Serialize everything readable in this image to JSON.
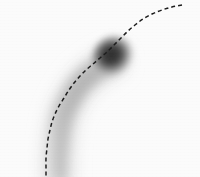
{
  "figure": {
    "title": "Curved particle trail with dashed reference trajectory",
    "width": 200,
    "height": 177,
    "background_color": "#fbfbfb",
    "image_kind": "grayscale-photograph"
  },
  "chart_data": {
    "type": "scatter",
    "title": "Curved particle trail with dashed reference trajectory",
    "subtitle": "",
    "xlabel": "",
    "ylabel": "",
    "xlim": [
      0,
      200
    ],
    "ylim": [
      177,
      0
    ],
    "grid": false,
    "legend": null,
    "axes_visible": false,
    "tick_labels": [],
    "annotations": [],
    "series": [
      {
        "name": "dashed-reference-curve",
        "style": "dashed",
        "color": "#1f1f1f",
        "line_width": 1.5,
        "dash_pattern": [
          4,
          3
        ],
        "points": [
          [
            182,
            5
          ],
          [
            172,
            7
          ],
          [
            162,
            10
          ],
          [
            152,
            14
          ],
          [
            143,
            19
          ],
          [
            135,
            25
          ],
          [
            128,
            31
          ],
          [
            121,
            38
          ],
          [
            114,
            45
          ],
          [
            107,
            52
          ],
          [
            100,
            58
          ],
          [
            93,
            64
          ],
          [
            86,
            70
          ],
          [
            80,
            76
          ],
          [
            74,
            83
          ],
          [
            69,
            90
          ],
          [
            64,
            98
          ],
          [
            59,
            106
          ],
          [
            55,
            114
          ],
          [
            52,
            122
          ],
          [
            50,
            130
          ],
          [
            48,
            139
          ],
          [
            47,
            148
          ],
          [
            46,
            158
          ],
          [
            46,
            168
          ],
          [
            46,
            177
          ]
        ]
      },
      {
        "name": "gray-particle-trail",
        "style": "tapered-band",
        "color": "#c9c9c9",
        "points": [
          [
            112,
            62
          ],
          [
            104,
            66
          ],
          [
            96,
            71
          ],
          [
            88,
            77
          ],
          [
            81,
            84
          ],
          [
            75,
            92
          ],
          [
            70,
            101
          ],
          [
            65,
            111
          ],
          [
            62,
            122
          ],
          [
            60,
            134
          ],
          [
            59,
            146
          ],
          [
            58,
            158
          ],
          [
            58,
            170
          ],
          [
            58,
            177
          ]
        ],
        "width_start": 22,
        "width_end": 24,
        "opacity_start": 0.85,
        "opacity_end": 0.35
      }
    ],
    "markers": [
      {
        "name": "dark-particle-blob",
        "shape": "soft-disc",
        "cx": 114,
        "cy": 56,
        "rx": 17,
        "ry": 16,
        "rotation": -32,
        "core_color": "#303030",
        "edge_color": "#d9d9d9",
        "core_radius_fraction": 0.42
      }
    ]
  }
}
